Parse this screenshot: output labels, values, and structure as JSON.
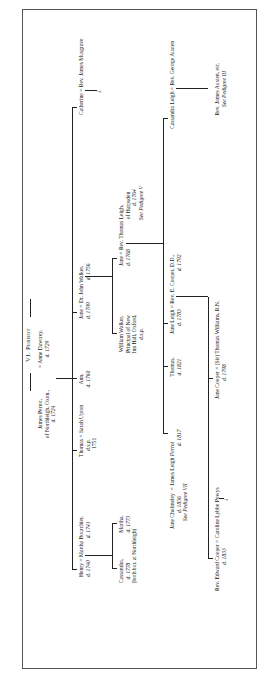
{
  "title": "VI. Perrot",
  "generation1": {
    "husband": {
      "name": "James Perrot,",
      "line2": "of Northleigh, Oxon.,",
      "death": "d. 1724"
    },
    "wife": {
      "name": "= Anne Dawtrey,",
      "death": "d. 1729"
    }
  },
  "generation2": [
    {
      "name": "Henry = Martha Bourchier,",
      "dates": "d. 1740",
      "spouse_death": "d. 1741"
    },
    {
      "name": "Thomas = Sarah Upton",
      "dates": "d.s.p.",
      "extra": "1751"
    },
    {
      "name": "Ann,",
      "dates": "d. 1760"
    },
    {
      "name": "Jane = Dr. John Walker,",
      "dates": "d. 1709",
      "spouse_death": "d. 1756"
    },
    {
      "name": "Catherine = Rev. James Musgrave"
    }
  ],
  "generation3": {
    "henry_children": [
      {
        "name": "Cassandra,",
        "dates": "d. 1778",
        "note": "(both bur. at Northleigh)"
      },
      {
        "name": "Martha,",
        "dates": "d. 1773"
      }
    ],
    "walker_children": [
      {
        "name": "William Walker,",
        "line2": "Principal of New",
        "line3": "Inn Hall, Oxford,",
        "line4": "d.s.p."
      },
      {
        "name": "Jane = Rev. Thomas Leigh,",
        "dates": "d. 1768",
        "line2": "of Harpsden",
        "spouse_death": "d. 1764",
        "ref": "See Pedigree V"
      }
    ]
  },
  "generation4": [
    {
      "name": "Jane Cholmeley",
      "connector": "= James Leigh",
      "surname_italic": "Perrot",
      "dates": "d. 1836",
      "spouse_death": "d. 1817",
      "ref": "See Pedigree VII"
    },
    {
      "name": "Thomas,",
      "dates": "d. 1821"
    },
    {
      "name": "Jane Leigh = Rev. E. Cooper, D.D.,",
      "dates": "d. 1783",
      "spouse_death": "d. 1792"
    },
    {
      "name": "Cassandra Leigh = Rev. George Austen"
    }
  ],
  "generation5": [
    {
      "name": "Rev. Edward Cooper = Caroline Lybbe Powys",
      "dates": "d. 1833"
    },
    {
      "name": "Jane Cooper = (Sir) Thomas Williams, R.N.",
      "dates": "d. 1798"
    },
    {
      "name": "Rev. James Austen, etc.",
      "ref": "See Pedigree III"
    }
  ],
  "icons": {
    "arrow": "→"
  }
}
